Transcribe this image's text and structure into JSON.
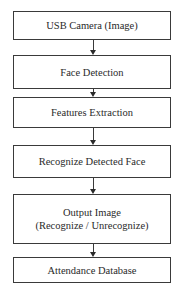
{
  "diagram": {
    "type": "flowchart",
    "direction": "top-to-bottom",
    "nodes": [
      {
        "id": "n1",
        "lines": [
          "USB Camera (Image)"
        ]
      },
      {
        "id": "n2",
        "lines": [
          "Face Detection"
        ]
      },
      {
        "id": "n3",
        "lines": [
          "Features Extraction"
        ]
      },
      {
        "id": "n4",
        "lines": [
          "Recognize Detected Face"
        ]
      },
      {
        "id": "n5",
        "lines": [
          "Output Image",
          "(Recognize / Unrecognize)"
        ]
      },
      {
        "id": "n6",
        "lines": [
          "Attendance Database"
        ]
      }
    ],
    "edges": [
      {
        "from": "n1",
        "to": "n2"
      },
      {
        "from": "n2",
        "to": "n3"
      },
      {
        "from": "n3",
        "to": "n4"
      },
      {
        "from": "n4",
        "to": "n5"
      },
      {
        "from": "n5",
        "to": "n6"
      }
    ],
    "colors": {
      "stroke": "#3a3a3a",
      "text": "#2a2a2a",
      "background": "#ffffff"
    }
  }
}
